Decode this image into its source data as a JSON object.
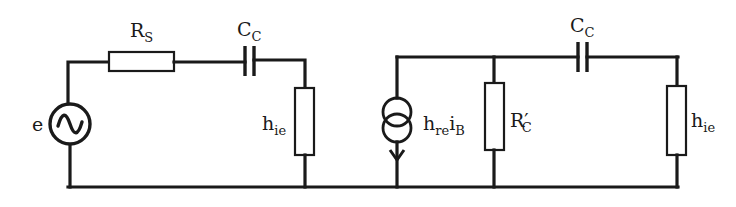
{
  "diagram": {
    "type": "circuit",
    "title": "",
    "colors": {
      "line": "#1a1a1a",
      "background": "#ffffff"
    },
    "components": [
      {
        "id": "source",
        "kind": "ac-voltage-source",
        "label": "e"
      },
      {
        "id": "rs",
        "kind": "resistor",
        "label_main": "R",
        "label_sub": "S"
      },
      {
        "id": "cc1",
        "kind": "capacitor",
        "label_main": "C",
        "label_sub": "C"
      },
      {
        "id": "hie1",
        "kind": "resistor",
        "label_main": "h",
        "label_sub": "ie"
      },
      {
        "id": "csrc",
        "kind": "dependent-current-source",
        "label_main1": "h",
        "label_sub1": "re",
        "label_main2": "i",
        "label_sub2": "B"
      },
      {
        "id": "rc",
        "kind": "resistor",
        "label_main": "R",
        "label_prime": "′",
        "label_sub": "C"
      },
      {
        "id": "cc2",
        "kind": "capacitor",
        "label_main": "C",
        "label_sub": "C"
      },
      {
        "id": "hie2",
        "kind": "resistor",
        "label_main": "h",
        "label_sub": "ie"
      }
    ],
    "connections": [
      "e top -> R_S -> C_C -> h_ie (left) -> ground",
      "e bottom -> ground",
      "h_re i_B current source between top node and ground (arrow pointing down)",
      "R'_C between top node and ground",
      "top node -> C_C -> h_ie (right) -> ground"
    ]
  }
}
